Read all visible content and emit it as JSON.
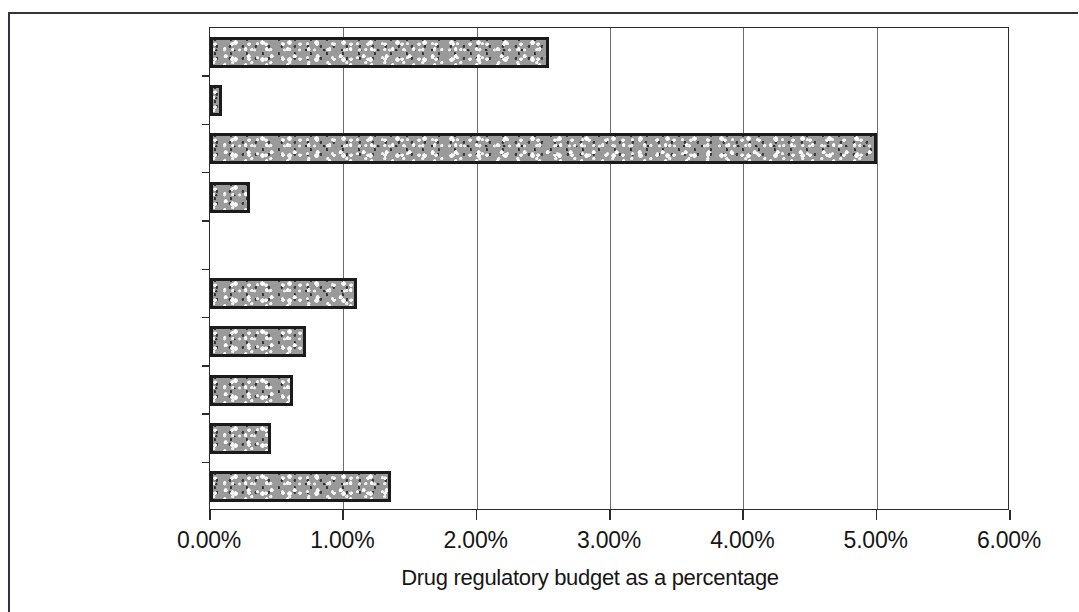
{
  "figure": {
    "axis_title": "Drug regulatory budget as a percentage",
    "frame_color": "#33333a",
    "bar_fill_color": "#9a9a9a",
    "bar_outline_color": "#1b1b1b",
    "gridline_color": "#6d6d6d"
  },
  "chart_data": {
    "type": "bar",
    "orientation": "horizontal",
    "title": "",
    "subtitle": "",
    "xlabel": "Drug regulatory budget as a percentage",
    "ylabel": "",
    "xlim": [
      0,
      6
    ],
    "ylim": null,
    "grid": true,
    "legend": null,
    "legend_position": "none",
    "xtick_labels": [
      "0.00%",
      "1.00%",
      "2.00%",
      "3.00%",
      "4.00%",
      "5.00%",
      "6.00%"
    ],
    "xtick_values": [
      0,
      1,
      2,
      3,
      4,
      5,
      6
    ],
    "categories": [
      "Zimbabwe",
      "Venezuela",
      "Uganda",
      "Tunisia",
      "Netherlands",
      "Malaysia",
      "Estonia",
      "Cyprus",
      "Cuba",
      "Australia"
    ],
    "values": [
      2.54,
      0.09,
      5.0,
      0.3,
      0.0,
      1.1,
      0.72,
      0.62,
      0.46,
      1.36
    ],
    "value_unit": "percent",
    "series": [
      {
        "name": "Drug regulatory budget as a percentage",
        "values": [
          2.54,
          0.09,
          5.0,
          0.3,
          0.0,
          1.1,
          0.72,
          0.62,
          0.46,
          1.36
        ]
      }
    ]
  }
}
